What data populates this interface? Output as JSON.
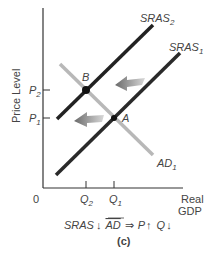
{
  "diagram": {
    "y_axis_label": "Price Level",
    "x_axis_label_line1": "Real",
    "x_axis_label_line2": "GDP",
    "origin_label": "0",
    "curves": {
      "sras2": {
        "name": "SRAS",
        "sub": "2"
      },
      "sras1": {
        "name": "SRAS",
        "sub": "1"
      },
      "ad1": {
        "name": "AD",
        "sub": "1"
      }
    },
    "points": {
      "b": "B",
      "a": "A"
    },
    "y_ticks": [
      {
        "name": "P",
        "sub": "2"
      },
      {
        "name": "P",
        "sub": "1"
      }
    ],
    "x_ticks": [
      {
        "name": "Q",
        "sub": "2"
      },
      {
        "name": "Q",
        "sub": "1"
      }
    ],
    "caption": "SRAS↓  AD ⇒ P↑  Q↓",
    "caption_parts": {
      "sras": "SRAS",
      "down1": "↓",
      "ad": "AD",
      "implies": "⇒",
      "p": "P",
      "up": "↑",
      "q": "Q",
      "down2": "↓"
    },
    "panel_label": "(c)",
    "colors": {
      "sras": "#222222",
      "ad": "#b8b8b8",
      "arrow": "#777777",
      "axis": "#333333"
    }
  }
}
